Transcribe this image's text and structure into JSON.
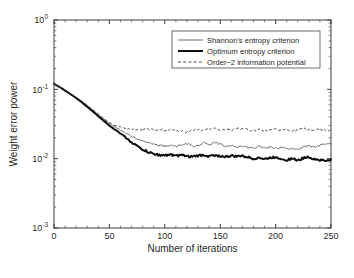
{
  "chart_data": {
    "type": "line",
    "title": "",
    "xlabel": "Number of iterations",
    "ylabel": "Weight error power",
    "xlim": [
      0,
      250
    ],
    "ylim": [
      0.001,
      1
    ],
    "yscale": "log",
    "xscale": "linear",
    "grid": false,
    "legend_position": "top-right",
    "xticks": [
      "0",
      "50",
      "100",
      "150",
      "200",
      "250"
    ],
    "xtick_values": [
      0,
      50,
      100,
      150,
      200,
      250
    ],
    "yticks": [
      "10^0",
      "10^-1",
      "10^-2",
      "10^-3"
    ],
    "ytick_values": [
      1,
      0.1,
      0.01,
      0.001
    ],
    "ytick_mantissa": [
      "10",
      "10",
      "10",
      "10"
    ],
    "ytick_exponents": [
      "0",
      "-1",
      "-2",
      "-3"
    ],
    "series": [
      {
        "name": "Shannon's entropy criterion",
        "color": "#6e6e6e",
        "style": "solid-thin",
        "x": [
          0,
          5,
          10,
          15,
          20,
          25,
          30,
          35,
          40,
          45,
          50,
          55,
          60,
          65,
          70,
          75,
          80,
          85,
          90,
          95,
          100,
          105,
          110,
          115,
          120,
          125,
          130,
          135,
          140,
          145,
          150,
          155,
          160,
          165,
          170,
          175,
          180,
          185,
          190,
          195,
          200,
          205,
          210,
          215,
          220,
          225,
          230,
          235,
          240,
          245,
          250
        ],
        "y": [
          0.12,
          0.108,
          0.097,
          0.086,
          0.076,
          0.067,
          0.058,
          0.05,
          0.043,
          0.037,
          0.032,
          0.0285,
          0.0258,
          0.0232,
          0.0212,
          0.0196,
          0.0182,
          0.017,
          0.0162,
          0.0156,
          0.0152,
          0.0156,
          0.015,
          0.0158,
          0.0163,
          0.015,
          0.0155,
          0.0168,
          0.0158,
          0.0172,
          0.016,
          0.015,
          0.0156,
          0.0148,
          0.0152,
          0.0144,
          0.0141,
          0.015,
          0.0143,
          0.0147,
          0.0142,
          0.0146,
          0.0138,
          0.0142,
          0.0136,
          0.0148,
          0.0152,
          0.0146,
          0.0156,
          0.016,
          0.0163
        ]
      },
      {
        "name": "Optimum entropy criterion",
        "color": "#0d0d0d",
        "style": "solid-thick",
        "x": [
          0,
          5,
          10,
          15,
          20,
          25,
          30,
          35,
          40,
          45,
          50,
          55,
          60,
          65,
          70,
          75,
          80,
          85,
          90,
          95,
          100,
          105,
          110,
          115,
          120,
          125,
          130,
          135,
          140,
          145,
          150,
          155,
          160,
          165,
          170,
          175,
          180,
          185,
          190,
          195,
          200,
          205,
          210,
          215,
          220,
          225,
          230,
          235,
          240,
          245,
          250
        ],
        "y": [
          0.12,
          0.108,
          0.096,
          0.085,
          0.075,
          0.065,
          0.056,
          0.048,
          0.041,
          0.035,
          0.03,
          0.0262,
          0.0232,
          0.02,
          0.0172,
          0.0152,
          0.0136,
          0.0124,
          0.0117,
          0.0113,
          0.0112,
          0.0115,
          0.011,
          0.0112,
          0.0108,
          0.0107,
          0.011,
          0.0113,
          0.0108,
          0.0112,
          0.0109,
          0.0106,
          0.011,
          0.0107,
          0.0111,
          0.0105,
          0.01,
          0.0104,
          0.0098,
          0.0103,
          0.0105,
          0.01,
          0.0096,
          0.0101,
          0.0094,
          0.0102,
          0.0106,
          0.0099,
          0.0096,
          0.0093,
          0.0097
        ]
      },
      {
        "name": "Order−2 information potential",
        "color": "#4a4a4a",
        "style": "dashed",
        "x": [
          0,
          5,
          10,
          15,
          20,
          25,
          30,
          35,
          40,
          45,
          50,
          55,
          60,
          65,
          70,
          75,
          80,
          85,
          90,
          95,
          100,
          105,
          110,
          115,
          120,
          125,
          130,
          135,
          140,
          145,
          150,
          155,
          160,
          165,
          170,
          175,
          180,
          185,
          190,
          195,
          200,
          205,
          210,
          215,
          220,
          225,
          230,
          235,
          240,
          245,
          250
        ],
        "y": [
          0.12,
          0.109,
          0.098,
          0.087,
          0.077,
          0.068,
          0.059,
          0.051,
          0.044,
          0.038,
          0.033,
          0.03,
          0.0285,
          0.0272,
          0.0268,
          0.0262,
          0.0268,
          0.0264,
          0.0258,
          0.0266,
          0.0252,
          0.0262,
          0.0254,
          0.0248,
          0.0244,
          0.0258,
          0.0264,
          0.0252,
          0.0268,
          0.0272,
          0.026,
          0.0268,
          0.0258,
          0.0272,
          0.0276,
          0.0262,
          0.0252,
          0.026,
          0.025,
          0.0258,
          0.0265,
          0.0256,
          0.0262,
          0.0252,
          0.0258,
          0.027,
          0.0264,
          0.0256,
          0.0262,
          0.0254,
          0.026
        ]
      }
    ]
  }
}
